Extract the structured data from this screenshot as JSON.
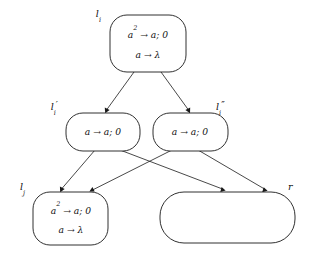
{
  "figure": {
    "kind": "spiking-neural-p-system-module",
    "background_color": "#ffffff",
    "stroke_color": "#1a1a1a",
    "text_color": "#111111",
    "width": 309,
    "height": 257
  },
  "nodes": {
    "li": {
      "label_base": "l",
      "label_sub": "i",
      "label_prime": "",
      "rules": [
        {
          "base": "a",
          "exp": "2",
          "rest": " → a; 0"
        },
        {
          "base": "a",
          "exp": "",
          "rest": " → λ"
        }
      ],
      "rule_lines": [
        "a2 → a; 0",
        "a → λ"
      ]
    },
    "li_prime": {
      "label_base": "l",
      "label_sub": "i",
      "label_prime": "′",
      "rules": [
        {
          "base": "a",
          "exp": "",
          "rest": " → a; 0"
        }
      ],
      "rule_lines": [
        "a → a; 0"
      ]
    },
    "li_double_prime": {
      "label_base": "l",
      "label_sub": "i",
      "label_prime": "″",
      "rules": [
        {
          "base": "a",
          "exp": "",
          "rest": " → a; 0"
        }
      ],
      "rule_lines": [
        "a → a; 0"
      ]
    },
    "lj": {
      "label_base": "l",
      "label_sub": "j",
      "label_prime": "",
      "rules": [
        {
          "base": "a",
          "exp": "2",
          "rest": " → a; 0"
        },
        {
          "base": "a",
          "exp": "",
          "rest": " → λ"
        }
      ],
      "rule_lines": [
        "a2 → a; 0",
        "a → λ"
      ]
    },
    "r": {
      "label_base": "r",
      "label_sub": "",
      "label_prime": "",
      "rules": [],
      "rule_lines": []
    }
  },
  "edges": [
    {
      "from": "li",
      "to": "li_prime"
    },
    {
      "from": "li",
      "to": "li_double_prime"
    },
    {
      "from": "li_prime",
      "to": "lj"
    },
    {
      "from": "li_prime",
      "to": "r"
    },
    {
      "from": "li_double_prime",
      "to": "lj"
    },
    {
      "from": "li_double_prime",
      "to": "r"
    }
  ]
}
